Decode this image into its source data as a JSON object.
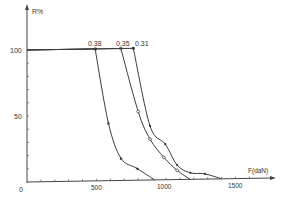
{
  "chart_data": {
    "type": "line",
    "title": "",
    "xlabel": "F(daN)",
    "ylabel": "R%",
    "xlim": [
      0,
      1750
    ],
    "ylim": [
      0,
      115
    ],
    "x_ticks": [
      0,
      500,
      1000,
      1500
    ],
    "x_tick_labels": [
      "0",
      "500",
      "1000",
      "1500"
    ],
    "y_ticks": [
      50,
      100
    ],
    "y_tick_labels": [
      "50",
      "100"
    ],
    "grid": false,
    "legend": "curve labels at top of each curve",
    "series": [
      {
        "name": "0.38",
        "marker": "arrow",
        "x": [
          0,
          490,
          585,
          675,
          790,
          920
        ],
        "y": [
          100,
          100,
          44,
          17,
          9,
          0
        ]
      },
      {
        "name": "0.35",
        "marker": "circle",
        "x": [
          0,
          675,
          800,
          885,
          985,
          1080,
          1175
        ],
        "y": [
          100,
          100,
          52,
          31,
          17,
          7,
          0
        ]
      },
      {
        "name": "0.31",
        "marker": "dot",
        "x": [
          0,
          765,
          885,
          995,
          1080,
          1175,
          1280,
          1400
        ],
        "y": [
          100,
          100,
          41,
          27,
          11,
          5,
          4,
          0
        ]
      }
    ]
  },
  "labels": {
    "y_axis": "R%",
    "x_axis": "F(daN)",
    "origin": "0",
    "y100": "100",
    "y50": "50",
    "x500": "500",
    "x1000": "1000",
    "x1500": "1500",
    "s1": "0.38",
    "s2": "0.35",
    "s3": "0.31"
  }
}
